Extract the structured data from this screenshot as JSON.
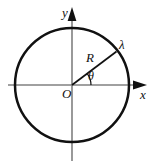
{
  "figure": {
    "type": "geometry-diagram",
    "background_color": "#ffffff",
    "axis_color": "#808080",
    "circle_color": "#111111",
    "radius_line_color": "#111111",
    "label_color": "#111111"
  },
  "labels": {
    "y_axis": "y",
    "x_axis": "x",
    "origin": "O",
    "radius": "R",
    "angle": "θ",
    "point": "λ"
  },
  "geometry": {
    "center": {
      "x": 72,
      "y": 85
    },
    "circle_radius": 57,
    "circle_stroke_width": 2.5,
    "axis_stroke_width": 1.6,
    "x_axis": {
      "x1": 8,
      "y1": 85,
      "x2": 146,
      "y2": 85
    },
    "y_axis": {
      "x1": 72,
      "y1": 8,
      "x2": 72,
      "y2": 161
    },
    "radius_line": {
      "x1": 72,
      "y1": 85,
      "x2": 116,
      "y2": 52
    },
    "angle_degrees": 37,
    "angle_arc_radius": 19,
    "arrowheads": [
      "x-axis-right",
      "y-axis-up"
    ]
  }
}
